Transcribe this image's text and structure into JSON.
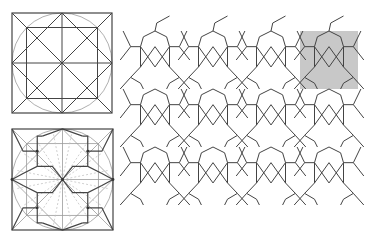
{
  "figure": {
    "panels": [
      {
        "id": "construction-grid",
        "label": "Construction grid: square with inscribed circle, diagonals, rotated square",
        "box": {
          "x": 12,
          "y": 13,
          "size": 100
        }
      },
      {
        "id": "motif-derivation",
        "label": "Motif derivation: star-cross motif overlaid on construction lines",
        "box": {
          "x": 12,
          "y": 129,
          "size": 101
        }
      },
      {
        "id": "tessellation",
        "label": "Repeating tessellation of star and cross motifs",
        "origin": {
          "x": 126,
          "y": 31
        },
        "tile": 58,
        "cols": 4,
        "rows": 3
      }
    ],
    "highlight": {
      "label": "Highlighted repeat unit",
      "x": 300,
      "y": 31,
      "w": 58,
      "h": 58,
      "color": "#c8c8c8"
    },
    "colors": {
      "line": "#444444",
      "construction": "#9a9a9a",
      "circle": "#b0b0b0",
      "dashed": "#bbbbbb"
    }
  }
}
